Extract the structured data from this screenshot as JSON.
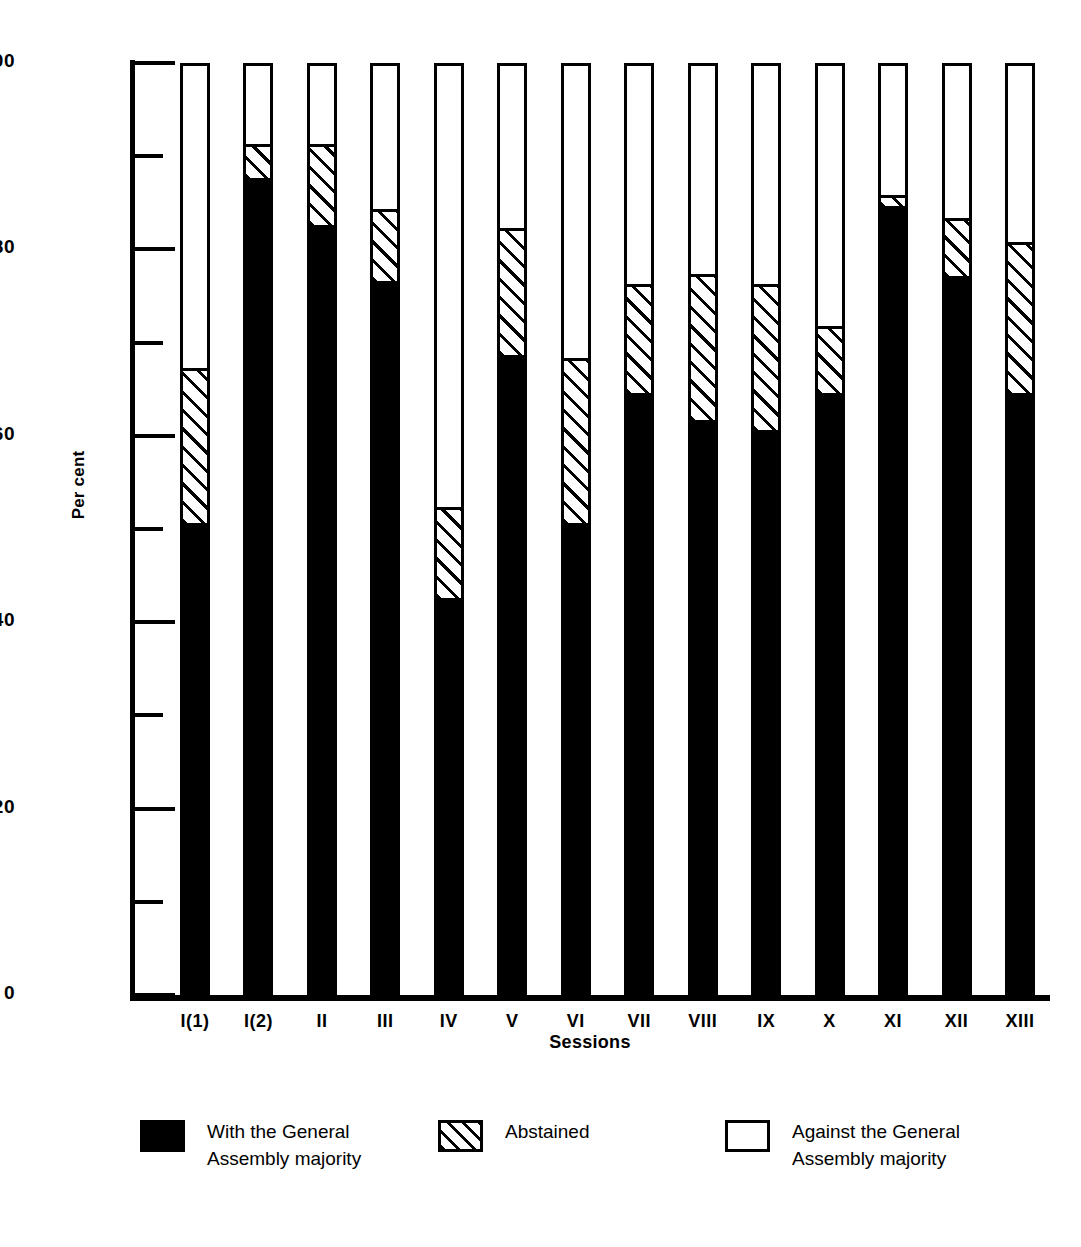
{
  "chart_data": {
    "type": "bar",
    "subtype": "stacked-percentage",
    "title": "",
    "xlabel": "Sessions",
    "ylabel": "Per cent",
    "ylim": [
      0,
      100
    ],
    "ytick_major": [
      0,
      20,
      40,
      60,
      80,
      100
    ],
    "ytick_minor": [
      10,
      30,
      50,
      70,
      90
    ],
    "ytick_labels": [
      "0",
      "20",
      "40",
      "60",
      "80",
      "100"
    ],
    "grid": false,
    "legend_position": "bottom",
    "categories": [
      "I(1)",
      "I(2)",
      "II",
      "III",
      "IV",
      "V",
      "VI",
      "VII",
      "VIII",
      "IX",
      "X",
      "XI",
      "XII",
      "XIII"
    ],
    "series": [
      {
        "name": "With the General Assembly majority",
        "fill": "solid-black",
        "color": "#000000",
        "values": [
          50,
          87,
          82,
          76,
          42,
          68,
          50,
          64,
          61,
          60,
          64,
          84,
          76.5,
          64
        ]
      },
      {
        "name": "Abstained",
        "fill": "diagonal-hatch",
        "color": "#ffffff",
        "values": [
          17,
          4,
          9,
          8,
          10,
          14,
          18,
          12,
          16,
          16,
          7.5,
          1.5,
          6.5,
          16.5
        ]
      },
      {
        "name": "Against the General Assembly majority",
        "fill": "open-white",
        "color": "#ffffff",
        "values": [
          33,
          9,
          9,
          16,
          48,
          18,
          32,
          24,
          23,
          24,
          28.5,
          14.5,
          17,
          19.5
        ]
      }
    ],
    "cumulative_tops": {
      "with_majority": [
        50,
        87,
        82,
        76,
        42,
        68,
        50,
        64,
        61,
        60,
        64,
        84,
        76.5,
        64
      ],
      "abstained_top": [
        67,
        91,
        91,
        84,
        52,
        82,
        68,
        76,
        77,
        76,
        71.5,
        85.5,
        83,
        80.5
      ],
      "total": [
        100,
        100,
        100,
        100,
        100,
        100,
        100,
        100,
        100,
        100,
        100,
        100,
        100,
        100
      ]
    }
  },
  "legend": {
    "entries": [
      {
        "label": "With the General\nAssembly majority",
        "swatch": "solid-black-swatch"
      },
      {
        "label": "Abstained",
        "swatch": "hatched-swatch"
      },
      {
        "label": "Against the General\nAssembly majority",
        "swatch": "open-swatch"
      }
    ]
  },
  "colors": {
    "ink": "#000000",
    "paper": "#ffffff"
  }
}
